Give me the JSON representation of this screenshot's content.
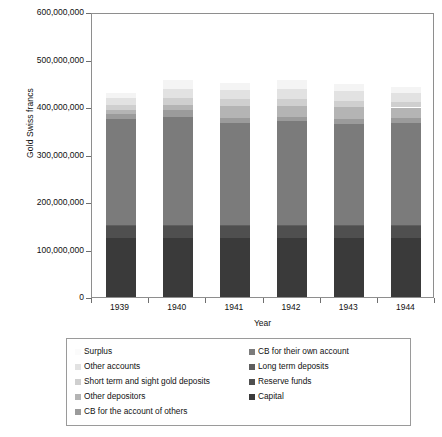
{
  "chart_data": {
    "type": "bar",
    "subtype": "stacked-vertical",
    "title": "",
    "xlabel": "Year",
    "ylabel": "Gold Swiss francs",
    "categories": [
      "1939",
      "1940",
      "1941",
      "1942",
      "1943",
      "1944"
    ],
    "ylim": [
      0,
      600000000
    ],
    "yticks": [
      0,
      100000000,
      200000000,
      300000000,
      400000000,
      500000000,
      600000000
    ],
    "ytick_labels": [
      "0",
      "100,000,000",
      "200,000,000",
      "300,000,000",
      "400,000,000",
      "500,000,000",
      "600,000,000"
    ],
    "grid": false,
    "legend_position": "below-plot",
    "series": [
      {
        "name": "Capital",
        "color": "#3a3a3a",
        "values": [
          125000000,
          125000000,
          125000000,
          125000000,
          125000000,
          125000000
        ]
      },
      {
        "name": "Reserve funds",
        "color": "#4f4f4f",
        "values": [
          24000000,
          24000000,
          24000000,
          24000000,
          24000000,
          24000000
        ]
      },
      {
        "name": "Long term deposits",
        "color": "#5e5e5e",
        "values": [
          3000000,
          3000000,
          3000000,
          3000000,
          3000000,
          3000000
        ]
      },
      {
        "name": "CB for their own account",
        "color": "#7b7b7b",
        "values": [
          222000000,
          228000000,
          215000000,
          218000000,
          213000000,
          215000000
        ]
      },
      {
        "name": "CB for the account of others",
        "color": "#9b9b9b",
        "values": [
          12000000,
          14000000,
          10000000,
          10000000,
          10000000,
          10000000
        ]
      },
      {
        "name": "Other depositors",
        "color": "#b4b4b4",
        "values": [
          8000000,
          10000000,
          26000000,
          22000000,
          24000000,
          22000000
        ]
      },
      {
        "name": "Short term and sight gold deposits",
        "color": "#cfcfcf",
        "values": [
          10000000,
          14000000,
          14000000,
          14000000,
          14000000,
          12000000
        ]
      },
      {
        "name": "Other accounts",
        "color": "#e2e2e2",
        "values": [
          14000000,
          20000000,
          18000000,
          22000000,
          20000000,
          18000000
        ]
      },
      {
        "name": "Surplus",
        "color": "#f4f4f4",
        "values": [
          12000000,
          18000000,
          16000000,
          18000000,
          16000000,
          14000000
        ]
      }
    ],
    "totals": [
      430000000,
      456000000,
      451000000,
      456000000,
      446000000,
      441000000
    ]
  },
  "axes": {
    "y_title": "Gold Swiss francs",
    "x_title": "Year",
    "y_tick_labels": [
      "600,000,000",
      "500,000,000",
      "400,000,000",
      "300,000,000",
      "200,000,000",
      "100,000,000",
      "0"
    ],
    "x_tick_labels": [
      "1939",
      "1940",
      "1941",
      "1942",
      "1943",
      "1944"
    ]
  },
  "legend": {
    "left_column": [
      {
        "label": "Surplus",
        "color": "#f4f4f4"
      },
      {
        "label": "Other accounts",
        "color": "#e2e2e2"
      },
      {
        "label": "Short term and sight gold deposits",
        "color": "#cfcfcf"
      },
      {
        "label": "Other depositors",
        "color": "#b4b4b4"
      },
      {
        "label": "CB for the account of others",
        "color": "#9b9b9b"
      }
    ],
    "right_column": [
      {
        "label": "CB for their own account",
        "color": "#7b7b7b"
      },
      {
        "label": "Long term deposits",
        "color": "#5e5e5e"
      },
      {
        "label": "Reserve funds",
        "color": "#4f4f4f"
      },
      {
        "label": "Capital",
        "color": "#3a3a3a"
      }
    ]
  }
}
